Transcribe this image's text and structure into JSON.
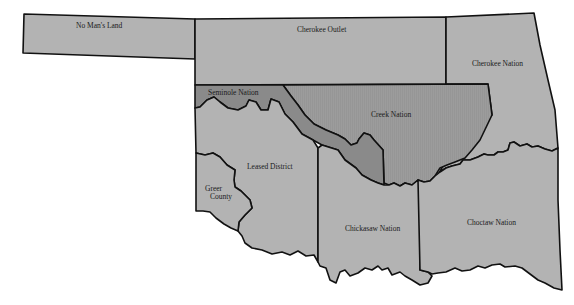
{
  "map": {
    "title": "Indian Territory and Oklahoma regions",
    "colors": {
      "background": "#ffffff",
      "light_region": "#b3b3b3",
      "creek_region": "#9c9c9c",
      "seminole_region": "#8a8a8a",
      "border": "#111111"
    },
    "regions": [
      {
        "id": "no-mans-land",
        "label": "No Man's Land"
      },
      {
        "id": "cherokee-outlet",
        "label": "Cherokee Outlet"
      },
      {
        "id": "cherokee-nation",
        "label": "Cherokee Nation"
      },
      {
        "id": "seminole-nation",
        "label": "Seminole Nation"
      },
      {
        "id": "creek-nation",
        "label": "Creek Nation"
      },
      {
        "id": "leased-district",
        "label": "Leased District"
      },
      {
        "id": "greer-county",
        "label": "Greer County",
        "label_lines": [
          "Greer",
          "County"
        ]
      },
      {
        "id": "chickasaw-nation",
        "label": "Chickasaw Nation"
      },
      {
        "id": "choctaw-nation",
        "label": "Choctaw Nation"
      }
    ]
  }
}
